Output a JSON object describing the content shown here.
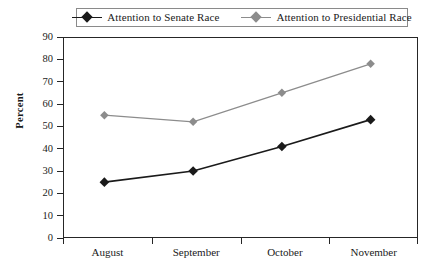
{
  "chart_data": {
    "type": "line",
    "title": "",
    "xlabel": "",
    "ylabel": "Percent",
    "categories": [
      "August",
      "September",
      "October",
      "November"
    ],
    "ylim": [
      0,
      90
    ],
    "yticks": [
      0,
      10,
      20,
      30,
      40,
      50,
      60,
      70,
      80,
      90
    ],
    "grid": false,
    "legend_position": "top",
    "series": [
      {
        "name": "Attention to Senate Race",
        "color": "#1a1a1a",
        "marker": "diamond",
        "values": [
          25,
          30,
          41,
          53
        ]
      },
      {
        "name": "Attention to Presidential Race",
        "color": "#8c8c8c",
        "marker": "diamond",
        "values": [
          55,
          52,
          65,
          78
        ]
      }
    ]
  },
  "legend": {
    "entries": [
      {
        "label": "Attention to Senate Race",
        "color": "#1a1a1a"
      },
      {
        "label": "Attention to Presidential Race",
        "color": "#8c8c8c"
      }
    ]
  },
  "axis": {
    "y_title": "Percent",
    "y_labels": [
      "90",
      "80",
      "70",
      "60",
      "50",
      "40",
      "30",
      "20",
      "10",
      "0"
    ],
    "x_labels": [
      "August",
      "September",
      "October",
      "November"
    ]
  },
  "caption": {
    "text": ""
  },
  "colors": {
    "senate_line": "#1a1a1a",
    "presidential_line": "#8c8c8c",
    "axis": "#262626",
    "legend_border": "#8a8a8a",
    "background": "#ffffff"
  }
}
